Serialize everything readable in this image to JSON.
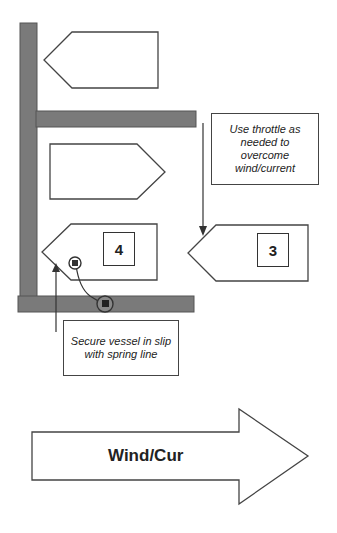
{
  "diagram": {
    "colors": {
      "dock": "#7a7a7a",
      "outline": "#444444",
      "background": "#ffffff"
    },
    "boats": [
      {
        "id": "top-boat",
        "direction": "left"
      },
      {
        "id": "middle-boat",
        "direction": "right"
      },
      {
        "id": "boat-4",
        "direction": "left",
        "label": "4"
      },
      {
        "id": "boat-3",
        "direction": "left",
        "label": "3"
      }
    ],
    "notes": {
      "throttle": "Use throttle as needed to overcome wind/current",
      "spring": "Secure vessel in slip with spring line"
    },
    "wind_arrow": {
      "label": "Wind/Cur",
      "direction": "right"
    }
  }
}
